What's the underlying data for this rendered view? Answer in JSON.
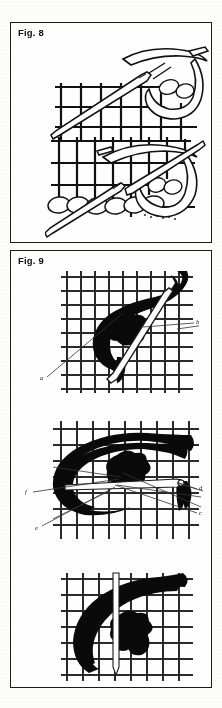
{
  "page": {
    "background_color": "#fdfdfb",
    "ink_color": "#111111",
    "figure_count": 2
  },
  "figures": [
    {
      "id": "fig8",
      "caption": "Fig. 8",
      "style": "line-art outline",
      "panel_count": 2,
      "subject": "needle and thread worked through canvas mesh grid",
      "panels": [
        {
          "id": "fig8-panel-1",
          "name": "needle entering canvas",
          "grid_columns": 7,
          "grid_rows": 5
        },
        {
          "id": "fig8-panel-2",
          "name": "row of completed stitches with needle",
          "grid_columns": 8,
          "grid_rows": 5
        }
      ]
    },
    {
      "id": "fig9",
      "caption": "Fig. 9",
      "style": "solid black thread on canvas mesh",
      "panel_count": 3,
      "subject": "thick yarn loop formed over canvas with needle",
      "panels": [
        {
          "id": "fig9-panel-1",
          "name": "loop with needle passing through",
          "grid_columns": 9,
          "grid_rows": 9
        },
        {
          "id": "fig9-panel-2",
          "name": "loop secured, callouts c d e f",
          "grid_columns": 9,
          "grid_rows": 8
        },
        {
          "id": "fig9-panel-3",
          "name": "finished knot with vertical bar",
          "grid_columns": 8,
          "grid_rows": 9
        }
      ],
      "callouts": [
        {
          "key": "a",
          "label": "a",
          "x": 39,
          "y": 378,
          "leader_to_x": 118,
          "leader_to_y": 312
        },
        {
          "key": "b",
          "label": "b",
          "x": 196,
          "y": 321,
          "leader_to_x": 122,
          "leader_to_y": 330
        },
        {
          "key": "c",
          "label": "c",
          "x": 199,
          "y": 512,
          "leader_to_x": 104,
          "leader_to_y": 484
        },
        {
          "key": "d",
          "label": "d",
          "x": 199,
          "y": 487,
          "leader_to_x": 167,
          "leader_to_y": 480
        },
        {
          "key": "e",
          "label": "e",
          "x": 35,
          "y": 527,
          "leader_to_x": 110,
          "leader_to_y": 486
        },
        {
          "key": "f",
          "label": "f",
          "x": 25,
          "y": 491,
          "leader_to_x": 112,
          "leader_to_y": 478
        }
      ]
    }
  ]
}
